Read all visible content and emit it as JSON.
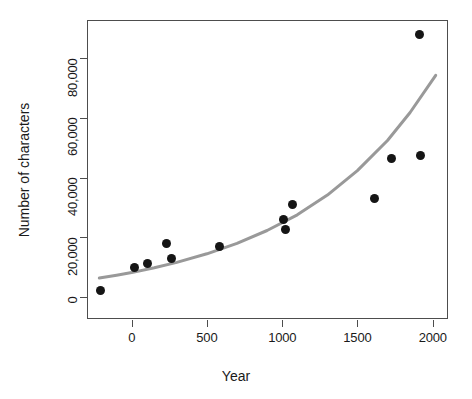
{
  "chart_data": {
    "type": "scatter",
    "title": "",
    "xlabel": "Year",
    "ylabel": "Number of characters",
    "xlim": [
      -300,
      2060
    ],
    "ylim": [
      -3500,
      93000
    ],
    "grid": false,
    "legend": "none",
    "x_ticks": [
      0,
      500,
      1000,
      1500,
      2000
    ],
    "x_tick_labels": [
      "0",
      "500",
      "1000",
      "1500",
      "2000"
    ],
    "y_ticks": [
      0,
      20000,
      40000,
      60000,
      80000
    ],
    "y_tick_labels": [
      "0",
      "20,000",
      "40,000",
      "60,000",
      "80,000"
    ],
    "marker_color": "#151515",
    "marker_shape": "filled-circle",
    "points": [
      {
        "x": -205,
        "y": 2200
      },
      {
        "x": 20,
        "y": 9700
      },
      {
        "x": 105,
        "y": 11000
      },
      {
        "x": 230,
        "y": 18000
      },
      {
        "x": 265,
        "y": 13000
      },
      {
        "x": 580,
        "y": 17000
      },
      {
        "x": 1010,
        "y": 26000
      },
      {
        "x": 1020,
        "y": 22500
      },
      {
        "x": 1065,
        "y": 31000
      },
      {
        "x": 1615,
        "y": 33000
      },
      {
        "x": 1725,
        "y": 46500
      },
      {
        "x": 1920,
        "y": 47500
      },
      {
        "x": 1915,
        "y": 88000
      }
    ],
    "fit_curve": {
      "name": "exponential-fit",
      "color": "#999999",
      "width": 3,
      "points": [
        {
          "x": -215,
          "y": 6300
        },
        {
          "x": -100,
          "y": 7200
        },
        {
          "x": 0,
          "y": 8100
        },
        {
          "x": 150,
          "y": 9700
        },
        {
          "x": 300,
          "y": 11500
        },
        {
          "x": 500,
          "y": 14400
        },
        {
          "x": 700,
          "y": 17900
        },
        {
          "x": 900,
          "y": 22200
        },
        {
          "x": 1100,
          "y": 27500
        },
        {
          "x": 1300,
          "y": 34100
        },
        {
          "x": 1500,
          "y": 42300
        },
        {
          "x": 1700,
          "y": 52400
        },
        {
          "x": 1850,
          "y": 61800
        },
        {
          "x": 2020,
          "y": 74300
        }
      ]
    }
  }
}
